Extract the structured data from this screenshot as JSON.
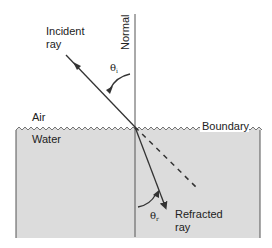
{
  "diagram": {
    "colors": {
      "background": "#ffffff",
      "water": "#dcdcdc",
      "stroke": "#333333",
      "text": "#222222"
    },
    "labels": {
      "incident_line1": "Incident",
      "incident_line2": "ray",
      "normal": "Normal",
      "theta_i": "θ",
      "theta_i_sub": "i",
      "air": "Air",
      "water": "Water",
      "boundary": "Boundary",
      "theta_r": "θ",
      "theta_r_sub": "r",
      "refracted_line1": "Refracted",
      "refracted_line2": "ray"
    },
    "geometry": {
      "intersection": [
        135,
        127
      ],
      "normal_top": [
        135,
        14
      ],
      "normal_bottom": [
        135,
        237
      ],
      "incident_start": [
        66,
        55
      ],
      "refracted_end": [
        165,
        206
      ],
      "dashed_end": [
        197,
        188
      ],
      "water_box": {
        "x": 16,
        "y": 128,
        "width": 244,
        "height": 110
      }
    }
  }
}
